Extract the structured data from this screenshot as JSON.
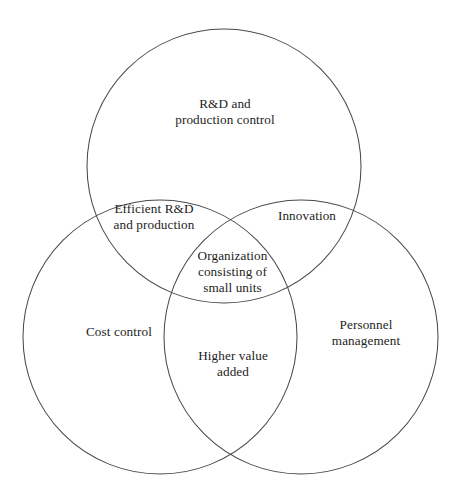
{
  "figure": {
    "type": "three-set-venn-diagram",
    "background_color": "#ffffff",
    "stroke_color": "#4a4a4a",
    "text_color": "#1d1d1d",
    "caption": ""
  },
  "sets": {
    "top": {
      "name": "top-circle",
      "label": "R&D and\nproduction control"
    },
    "left": {
      "name": "left-circle",
      "label": "Cost control"
    },
    "right": {
      "name": "right-circle",
      "label": "Personnel\nmanagement"
    }
  },
  "intersections": {
    "top_left": {
      "name": "top-and-left",
      "label": "Efficient R&D\nand production"
    },
    "top_right": {
      "name": "top-and-right",
      "label": "Innovation"
    },
    "left_right": {
      "name": "left-and-right",
      "label": "Higher value\nadded"
    },
    "center": {
      "name": "all-three",
      "label": "Organization\nconsisting of\nsmall units"
    }
  },
  "geometry": {
    "radius": 137,
    "top_circle": {
      "cx": 224,
      "cy": 166
    },
    "left_circle": {
      "cx": 160,
      "cy": 337
    },
    "right_circle": {
      "cx": 301,
      "cy": 337
    }
  }
}
